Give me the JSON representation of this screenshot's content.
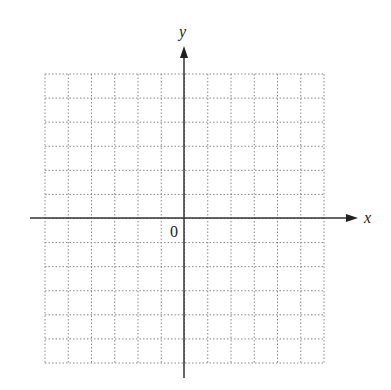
{
  "diagram": {
    "type": "coordinate-grid",
    "axes": {
      "x_label": "x",
      "y_label": "y",
      "origin_label": "0"
    },
    "grid": {
      "columns": 12,
      "rows": 12,
      "line_style": "dotted",
      "line_color": "#888888"
    },
    "axis_color": "#333333"
  }
}
